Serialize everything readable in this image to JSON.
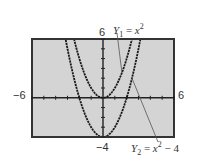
{
  "chart_data": {
    "type": "line",
    "title": "",
    "xlabel": "",
    "ylabel": "",
    "xlim": [
      -6,
      6
    ],
    "ylim": [
      -4,
      6
    ],
    "grid": false,
    "tick_labels": {
      "x_min": "−6",
      "x_max": "6",
      "y_max": "6",
      "y_min": "−4"
    },
    "series": [
      {
        "name": "Y1 = x^2",
        "expression": "x^2",
        "label_var": "Y",
        "label_sub": "1",
        "label_rhs_base": "x",
        "label_rhs_exp": "2",
        "label_rhs_tail": ""
      },
      {
        "name": "Y2 = x^2 − 4",
        "expression": "x^2 - 4",
        "label_var": "Y",
        "label_sub": "2",
        "label_rhs_base": "x",
        "label_rhs_exp": "2",
        "label_rhs_tail": " − 4"
      }
    ],
    "annotations": [
      "Y1 = x^2 (leader line to upper curve)",
      "Y2 = x^2 − 4 (leader line to lower curve)"
    ],
    "frame_background": "#d4d4d4",
    "curve_color": "#1a1a1a"
  }
}
